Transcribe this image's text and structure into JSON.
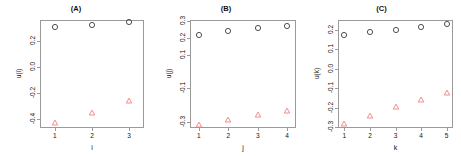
{
  "figure": {
    "background": "#ffffff",
    "circle_color": "#3d3d3d",
    "triangle_color": "#f08080",
    "axis_color": "#9a9a9a"
  },
  "chart_data": [
    {
      "type": "scatter",
      "title": "(A)",
      "xlabel": "i",
      "ylabel": "u(i)",
      "x": [
        1,
        2,
        3
      ],
      "xlim": [
        0.6,
        3.4
      ],
      "ylim": [
        -0.47,
        0.36
      ],
      "xticks": [
        "1",
        "2",
        "3"
      ],
      "yticks": [
        "0.2",
        "0.0",
        "-0.2",
        "-0.4"
      ],
      "ytick_values": [
        0.2,
        0.0,
        -0.2,
        -0.4
      ],
      "grid": false,
      "legend": "none",
      "series": [
        {
          "name": "circles",
          "marker": "circle",
          "color": "#3d3d3d",
          "values": [
            0.305,
            0.325,
            0.345
          ]
        },
        {
          "name": "triangles",
          "marker": "triangle",
          "color": "#f08080",
          "values": [
            -0.435,
            -0.355,
            -0.265
          ]
        }
      ]
    },
    {
      "type": "scatter",
      "title": "(B)",
      "xlabel": "j",
      "ylabel": "u(j)",
      "x": [
        1,
        2,
        3,
        4
      ],
      "xlim": [
        0.7,
        4.3
      ],
      "ylim": [
        -0.335,
        0.305
      ],
      "xticks": [
        "1",
        "2",
        "3",
        "4"
      ],
      "yticks": [
        "0.3",
        "0.2",
        "0.1",
        "-0.1",
        "-0.3"
      ],
      "ytick_values": [
        0.3,
        0.2,
        0.1,
        -0.1,
        -0.3
      ],
      "grid": false,
      "legend": "none",
      "series": [
        {
          "name": "circles",
          "marker": "circle",
          "color": "#3d3d3d",
          "values": [
            0.215,
            0.238,
            0.255,
            0.272
          ]
        },
        {
          "name": "triangles",
          "marker": "triangle",
          "color": "#f08080",
          "values": [
            -0.315,
            -0.287,
            -0.255,
            -0.235
          ]
        }
      ]
    },
    {
      "type": "scatter",
      "title": "(C)",
      "xlabel": "k",
      "ylabel": "u(k)",
      "x": [
        1,
        2,
        3,
        4,
        5
      ],
      "xlim": [
        0.75,
        5.25
      ],
      "ylim": [
        -0.305,
        0.25
      ],
      "xticks": [
        "1",
        "2",
        "3",
        "4",
        "5"
      ],
      "yticks": [
        "0.2",
        "0.1",
        "0.0",
        "-0.1",
        "-0.2",
        "-0.3"
      ],
      "ytick_values": [
        0.2,
        0.1,
        0.0,
        -0.1,
        -0.2,
        -0.3
      ],
      "grid": false,
      "legend": "none",
      "series": [
        {
          "name": "circles",
          "marker": "circle",
          "color": "#3d3d3d",
          "values": [
            0.172,
            0.186,
            0.2,
            0.214,
            0.228
          ]
        },
        {
          "name": "triangles",
          "marker": "triangle",
          "color": "#f08080",
          "values": [
            -0.283,
            -0.242,
            -0.199,
            -0.161,
            -0.123
          ]
        }
      ]
    }
  ]
}
